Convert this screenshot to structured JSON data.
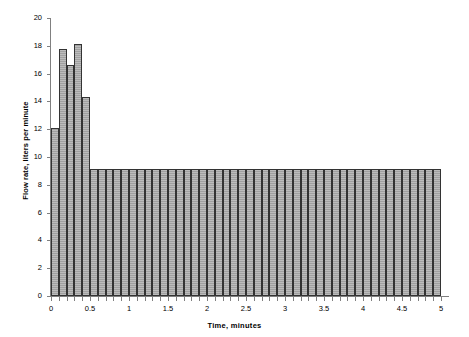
{
  "chart_data": {
    "type": "bar",
    "title": "",
    "xlabel": "Time, minutes",
    "ylabel": "Flow rate, liters per minute",
    "xlim": [
      0,
      5
    ],
    "ylim": [
      0,
      20
    ],
    "grid": false,
    "legend": null,
    "bar_width": 0.1,
    "xticks": [
      0,
      0.5,
      1,
      1.5,
      2,
      2.5,
      3,
      3.5,
      4,
      4.5,
      5
    ],
    "xtick_labels": [
      "0",
      "0.5",
      "1",
      "1.5",
      "2",
      "2.5",
      "3",
      "3.5",
      "4",
      "4.5",
      "5"
    ],
    "xtick_minor_step": 0.1,
    "yticks": [
      0,
      2,
      4,
      6,
      8,
      10,
      12,
      14,
      16,
      18,
      20
    ],
    "ytick_labels": [
      "0",
      "2",
      "4",
      "6",
      "8",
      "10",
      "12",
      "14",
      "16",
      "18",
      "20"
    ],
    "bar_fill_color": "#a9a9a9",
    "bar_edge_color": "#333333",
    "axis_color": "#808080",
    "x": [
      0.05,
      0.15,
      0.25,
      0.35,
      0.45,
      0.55,
      0.65,
      0.75,
      0.85,
      0.95,
      1.05,
      1.15,
      1.25,
      1.35,
      1.45,
      1.55,
      1.65,
      1.75,
      1.85,
      1.95,
      2.05,
      2.15,
      2.25,
      2.35,
      2.45,
      2.55,
      2.65,
      2.75,
      2.85,
      2.95,
      3.05,
      3.15,
      3.25,
      3.35,
      3.45,
      3.55,
      3.65,
      3.75,
      3.85,
      3.95,
      4.05,
      4.15,
      4.25,
      4.35,
      4.45,
      4.55,
      4.65,
      4.75,
      4.85,
      4.95
    ],
    "values": [
      12.1,
      17.75,
      16.65,
      18.1,
      14.35,
      9.15,
      9.15,
      9.15,
      9.15,
      9.15,
      9.15,
      9.15,
      9.15,
      9.15,
      9.15,
      9.15,
      9.15,
      9.15,
      9.15,
      9.15,
      9.15,
      9.15,
      9.15,
      9.15,
      9.15,
      9.15,
      9.15,
      9.15,
      9.15,
      9.15,
      9.15,
      9.15,
      9.15,
      9.15,
      9.15,
      9.15,
      9.15,
      9.15,
      9.15,
      9.15,
      9.15,
      9.15,
      9.15,
      9.15,
      9.15,
      9.15,
      9.15,
      9.15,
      9.15,
      9.15
    ]
  }
}
